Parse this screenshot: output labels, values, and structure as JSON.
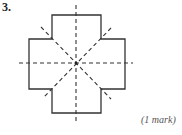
{
  "question": {
    "number": "3.",
    "marks": "(1 mark)"
  },
  "figure": {
    "shape": "plus-shaped cross (regular cross with four equal square arms)",
    "outline_color": "#333333",
    "dashed_line_color": "#333333",
    "lines_of_symmetry": 4,
    "symmetry_lines": [
      "vertical",
      "horizontal",
      "diagonal-down",
      "diagonal-up"
    ]
  }
}
